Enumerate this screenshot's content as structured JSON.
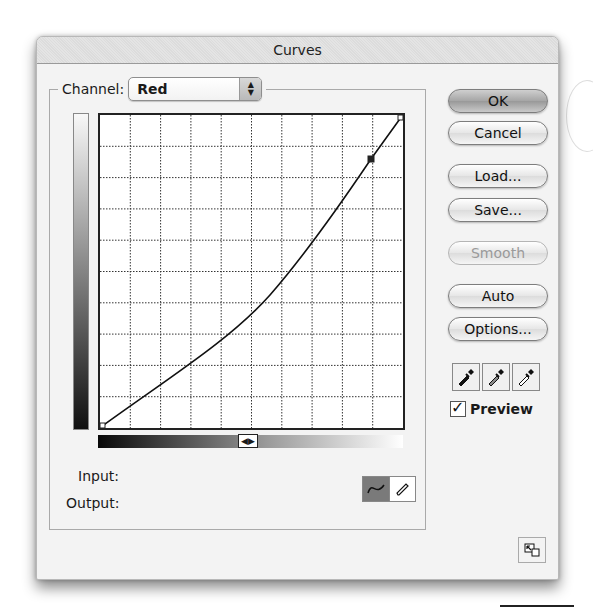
{
  "window": {
    "title": "Curves"
  },
  "channel": {
    "label": "Channel:",
    "value": "Red"
  },
  "curve": {
    "grid_divisions": 10,
    "points": [
      {
        "input": 0,
        "output": 0
      },
      {
        "input": 0.895,
        "output": 0.86
      },
      {
        "input": 1,
        "output": 1
      }
    ]
  },
  "io": {
    "input_label": "Input:",
    "output_label": "Output:",
    "input_value": "",
    "output_value": ""
  },
  "buttons": {
    "ok": "OK",
    "cancel": "Cancel",
    "load": "Load...",
    "save": "Save...",
    "smooth": "Smooth",
    "auto": "Auto",
    "options": "Options..."
  },
  "eyedroppers": [
    "black-point",
    "gray-point",
    "white-point"
  ],
  "preview": {
    "label": "Preview",
    "checked": true
  },
  "tools": {
    "active": "curve",
    "items": [
      "curve",
      "pencil"
    ]
  }
}
